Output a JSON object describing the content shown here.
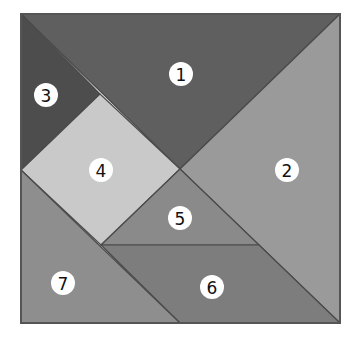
{
  "diagram": {
    "type": "tangram",
    "outline": {
      "x": 21,
      "y": 14,
      "width": 319,
      "height": 309,
      "stroke": "#555555"
    },
    "pieces": [
      {
        "id": "1",
        "label": "1",
        "shape": "large-triangle",
        "points": "21,14 340,14 180,169",
        "fill": "#5f5f5f",
        "label_pos": [
          181,
          74
        ]
      },
      {
        "id": "2",
        "label": "2",
        "shape": "large-triangle",
        "points": "340,14 340,323 180,169",
        "fill": "#9a9a9a",
        "label_pos": [
          287,
          170
        ]
      },
      {
        "id": "3",
        "label": "3",
        "shape": "small-triangle",
        "points": "21,14 100,94 21,170",
        "fill": "#4d4d4d",
        "label_pos": [
          46,
          95
        ]
      },
      {
        "id": "4",
        "label": "4",
        "shape": "square",
        "points": "100,94 180,169 101,245 21,170",
        "fill": "#c9c9c9",
        "label_pos": [
          101,
          170
        ]
      },
      {
        "id": "5",
        "label": "5",
        "shape": "small-triangle",
        "points": "180,169 259,245 101,245",
        "fill": "#8a8a8a",
        "label_pos": [
          180,
          218
        ]
      },
      {
        "id": "6",
        "label": "6",
        "shape": "parallelogram",
        "points": "101,245 259,245 340,323 180,323",
        "fill": "#7d7d7d",
        "label_pos": [
          212,
          287
        ]
      },
      {
        "id": "7",
        "label": "7",
        "shape": "medium-triangle",
        "points": "21,170 180,323 21,323",
        "fill": "#8e8e8e",
        "label_pos": [
          63,
          283
        ]
      }
    ],
    "label_radius": 12
  }
}
